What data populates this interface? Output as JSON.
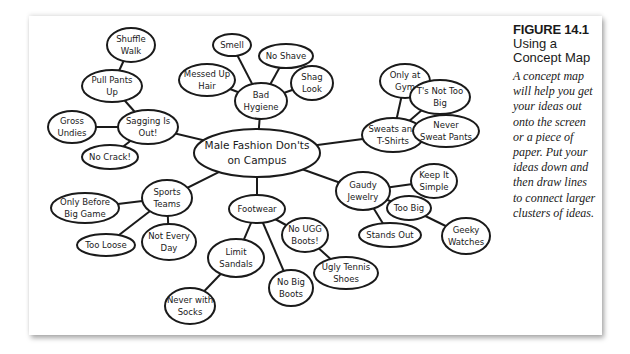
{
  "figure": {
    "number": "FIGURE 14.1",
    "title": "Using a Concept Map",
    "description": "A concept map will help you get your ideas out onto the screen or a piece of paper. Put your ideas down and then draw lines to connect larger clusters of ideas."
  },
  "concept_map": {
    "center": {
      "lines": [
        "Male Fashion Don'ts",
        "on Campus"
      ]
    },
    "nodes": {
      "bad_hygiene": {
        "lines": [
          "Bad",
          "Hygiene"
        ]
      },
      "smell": {
        "lines": [
          "Smell"
        ]
      },
      "no_shave": {
        "lines": [
          "No Shave"
        ]
      },
      "messed_up_hair": {
        "lines": [
          "Messed Up",
          "Hair"
        ]
      },
      "shag_look": {
        "lines": [
          "Shag",
          "Look"
        ]
      },
      "sagging": {
        "lines": [
          "Sagging Is",
          "Out!"
        ]
      },
      "pull_pants_up": {
        "lines": [
          "Pull Pants",
          "Up"
        ]
      },
      "shuffle_walk": {
        "lines": [
          "Shuffle",
          "Walk"
        ]
      },
      "gross_undies": {
        "lines": [
          "Gross",
          "Undies"
        ]
      },
      "no_crack": {
        "lines": [
          "No Crack!"
        ]
      },
      "sweats": {
        "lines": [
          "Sweats and",
          "T-Shirts"
        ]
      },
      "only_at_gym": {
        "lines": [
          "Only at",
          "Gym"
        ]
      },
      "ts_not_too_big": {
        "lines": [
          "T's Not Too",
          "Big"
        ]
      },
      "never_sweat_pants": {
        "lines": [
          "Never",
          "Sweat Pants"
        ]
      },
      "gaudy_jewelry": {
        "lines": [
          "Gaudy",
          "Jewelry"
        ]
      },
      "keep_it_simple": {
        "lines": [
          "Keep It",
          "Simple"
        ]
      },
      "too_big": {
        "lines": [
          "Too Big"
        ]
      },
      "stands_out": {
        "lines": [
          "Stands Out"
        ]
      },
      "geeky_watches": {
        "lines": [
          "Geeky",
          "Watches"
        ]
      },
      "sports_teams": {
        "lines": [
          "Sports",
          "Teams"
        ]
      },
      "only_before_big_game": {
        "lines": [
          "Only Before",
          "Big Game"
        ]
      },
      "too_loose": {
        "lines": [
          "Too Loose"
        ]
      },
      "not_every_day": {
        "lines": [
          "Not Every",
          "Day"
        ]
      },
      "footwear": {
        "lines": [
          "Footwear"
        ]
      },
      "no_ugg_boots": {
        "lines": [
          "No UGG",
          "Boots!"
        ]
      },
      "limit_sandals": {
        "lines": [
          "Limit",
          "Sandals"
        ]
      },
      "no_big_boots": {
        "lines": [
          "No Big",
          "Boots"
        ]
      },
      "ugly_tennis_shoes": {
        "lines": [
          "Ugly Tennis",
          "Shoes"
        ]
      },
      "never_with_socks": {
        "lines": [
          "Never with",
          "Socks"
        ]
      }
    }
  }
}
